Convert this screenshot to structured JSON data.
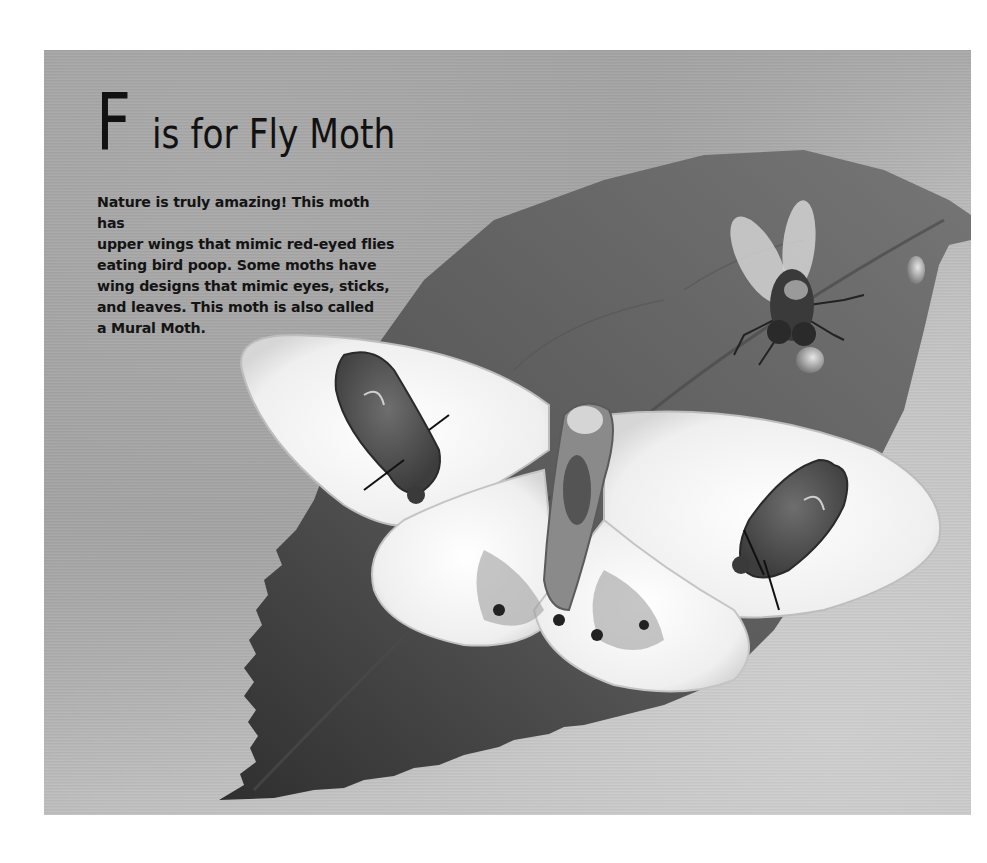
{
  "page": {
    "title_initial": "F",
    "title_rest": "is for Fly Moth",
    "body_lines": [
      "Nature is truly amazing! This moth has",
      "upper wings that mimic red-eyed flies",
      "eating bird poop. Some moths have",
      "wing designs that mimic eyes, sticks,",
      "and leaves. This moth is also called",
      "a Mural Moth."
    ]
  },
  "illustration": {
    "subjects": [
      "leaf",
      "fly-moth",
      "house-fly",
      "water-droplet"
    ],
    "colors": {
      "background": "#a8a8a8",
      "leaf": "#5e5e5e",
      "leaf_shadow": "#2e2e2e",
      "moth_wing": "#f2f2f2",
      "fly_mimic_patch": "#5a5a5a",
      "text": "#141414"
    }
  }
}
